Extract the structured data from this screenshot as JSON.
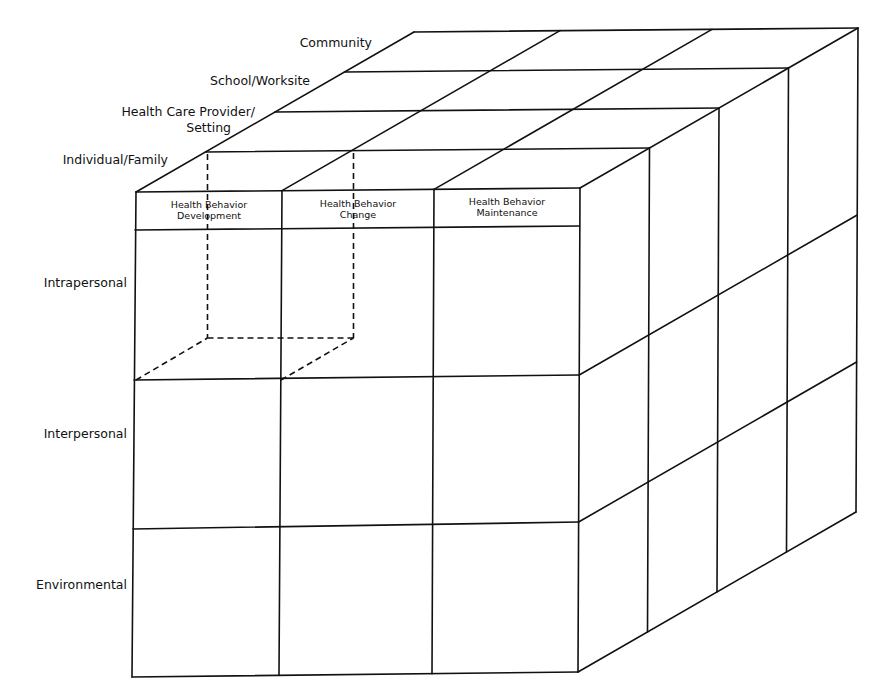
{
  "diagram": {
    "type": "3d-cube-matrix",
    "line_color": "#111111",
    "background": "#ffffff",
    "depth_layers": [
      {
        "id": "individual",
        "lines": [
          "Individual/Family"
        ]
      },
      {
        "id": "provider",
        "lines": [
          "Health Care Provider/",
          "Setting"
        ]
      },
      {
        "id": "school",
        "lines": [
          "School/Worksite"
        ]
      },
      {
        "id": "community",
        "lines": [
          "Community"
        ]
      }
    ],
    "columns": [
      {
        "id": "development",
        "lines": [
          "Health Behavior",
          "Development"
        ]
      },
      {
        "id": "change",
        "lines": [
          "Health Behavior",
          "Change"
        ]
      },
      {
        "id": "maintenance",
        "lines": [
          "Health Behavior",
          "Maintenance"
        ]
      }
    ],
    "rows": [
      {
        "id": "intrapersonal",
        "label": "Intrapersonal"
      },
      {
        "id": "interpersonal",
        "label": "Interpersonal"
      },
      {
        "id": "environmental",
        "label": "Environmental"
      }
    ],
    "highlighted_cell": {
      "description": "Dashed sub-cube",
      "column": "development",
      "row": "intrapersonal",
      "depth_layer": "individual"
    }
  }
}
